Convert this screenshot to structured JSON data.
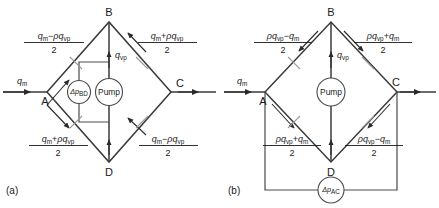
{
  "figure": {
    "panels": [
      {
        "id": "a",
        "caption": "(a)",
        "nodes": [
          {
            "id": "A",
            "label": "A"
          },
          {
            "id": "B",
            "label": "B"
          },
          {
            "id": "C",
            "label": "C"
          },
          {
            "id": "D",
            "label": "D"
          }
        ],
        "inlet_label": {
          "main": "q",
          "sub": "m"
        },
        "vertical_label": {
          "main": "q",
          "sub": "vp"
        },
        "instruments": [
          {
            "name": "delta-p-bd",
            "prefix": "Δp",
            "sub": "BD"
          },
          {
            "name": "pump",
            "text": "Pump"
          }
        ],
        "branch_labels": [
          {
            "position": "top-left",
            "numerator": "qₘ − ρqᵥₚ",
            "numerator_parts": [
              {
                "text": "q",
                "style": "italic"
              },
              {
                "text": "m",
                "style": "sub"
              },
              {
                "text": "−",
                "style": "op"
              },
              {
                "text": "ρq",
                "style": "italic"
              },
              {
                "text": "vp",
                "style": "sub"
              }
            ],
            "denominator": "2"
          },
          {
            "position": "top-right",
            "numerator": "qₘ + ρqᵥₚ",
            "numerator_parts": [
              {
                "text": "q",
                "style": "italic"
              },
              {
                "text": "m",
                "style": "sub"
              },
              {
                "text": "+",
                "style": "op"
              },
              {
                "text": "ρq",
                "style": "italic"
              },
              {
                "text": "vp",
                "style": "sub"
              }
            ],
            "denominator": "2"
          },
          {
            "position": "bottom-left",
            "numerator": "qₘ + ρqᵥₚ",
            "numerator_parts": [
              {
                "text": "q",
                "style": "italic"
              },
              {
                "text": "m",
                "style": "sub"
              },
              {
                "text": "+",
                "style": "op"
              },
              {
                "text": "ρq",
                "style": "italic"
              },
              {
                "text": "vp",
                "style": "sub"
              }
            ],
            "denominator": "2"
          },
          {
            "position": "bottom-right",
            "numerator": "qₘ − ρqᵥₚ",
            "numerator_parts": [
              {
                "text": "q",
                "style": "italic"
              },
              {
                "text": "m",
                "style": "sub"
              },
              {
                "text": "−",
                "style": "op"
              },
              {
                "text": "ρq",
                "style": "italic"
              },
              {
                "text": "vp",
                "style": "sub"
              }
            ],
            "denominator": "2"
          }
        ]
      },
      {
        "id": "b",
        "caption": "(b)",
        "nodes": [
          {
            "id": "A",
            "label": "A"
          },
          {
            "id": "B",
            "label": "B"
          },
          {
            "id": "C",
            "label": "C"
          },
          {
            "id": "D",
            "label": "D"
          }
        ],
        "inlet_label": {
          "main": "q",
          "sub": "m"
        },
        "vertical_label": {
          "main": "q",
          "sub": "vp"
        },
        "instruments": [
          {
            "name": "pump",
            "text": "Pump"
          },
          {
            "name": "delta-p-ac",
            "prefix": "Δp",
            "sub": "AC"
          }
        ],
        "branch_labels": [
          {
            "position": "top-left",
            "numerator": "ρqᵥₚ − qₘ",
            "numerator_parts": [
              {
                "text": "ρq",
                "style": "italic"
              },
              {
                "text": "vp",
                "style": "sub"
              },
              {
                "text": "−",
                "style": "op"
              },
              {
                "text": "q",
                "style": "italic"
              },
              {
                "text": "m",
                "style": "sub"
              }
            ],
            "denominator": "2"
          },
          {
            "position": "top-right",
            "numerator": "ρqᵥₚ + qₘ",
            "numerator_parts": [
              {
                "text": "ρq",
                "style": "italic"
              },
              {
                "text": "vp",
                "style": "sub"
              },
              {
                "text": "+",
                "style": "op"
              },
              {
                "text": "q",
                "style": "italic"
              },
              {
                "text": "m",
                "style": "sub"
              }
            ],
            "denominator": "2"
          },
          {
            "position": "bottom-left",
            "numerator": "ρqᵥₚ + qₘ",
            "numerator_parts": [
              {
                "text": "ρq",
                "style": "italic"
              },
              {
                "text": "vp",
                "style": "sub"
              },
              {
                "text": "+",
                "style": "op"
              },
              {
                "text": "q",
                "style": "italic"
              },
              {
                "text": "m",
                "style": "sub"
              }
            ],
            "denominator": "2"
          },
          {
            "position": "bottom-right",
            "numerator": "ρqᵥₚ − qₘ",
            "numerator_parts": [
              {
                "text": "ρq",
                "style": "italic"
              },
              {
                "text": "vp",
                "style": "sub"
              },
              {
                "text": "−",
                "style": "op"
              },
              {
                "text": "q",
                "style": "italic"
              },
              {
                "text": "m",
                "style": "sub"
              }
            ],
            "denominator": "2"
          }
        ]
      }
    ]
  },
  "panel_a": {
    "caption": "(a)",
    "node_a": "A",
    "node_b": "B",
    "node_c": "C",
    "node_d": "D",
    "inlet_main": "q",
    "inlet_sub": "m",
    "vert_main": "q",
    "vert_sub": "vp",
    "dp_prefix": "Δp",
    "dp_sub": "BD",
    "pump_text": "Pump",
    "tl_n1": "q",
    "tl_s1": "m",
    "tl_op": "−",
    "tl_n2": "ρq",
    "tl_s2": "vp",
    "tl_den": "2",
    "tr_n1": "q",
    "tr_s1": "m",
    "tr_op": "+",
    "tr_n2": "ρq",
    "tr_s2": "vp",
    "tr_den": "2",
    "bl_n1": "q",
    "bl_s1": "m",
    "bl_op": "+",
    "bl_n2": "ρq",
    "bl_s2": "vp",
    "bl_den": "2",
    "br_n1": "q",
    "br_s1": "m",
    "br_op": "−",
    "br_n2": "ρq",
    "br_s2": "vp",
    "br_den": "2"
  },
  "panel_b": {
    "caption": "(b)",
    "node_a": "A",
    "node_b": "B",
    "node_c": "C",
    "node_d": "D",
    "inlet_main": "q",
    "inlet_sub": "m",
    "vert_main": "q",
    "vert_sub": "vp",
    "dp_prefix": "Δp",
    "dp_sub": "AC",
    "pump_text": "Pump",
    "tl_n1": "ρq",
    "tl_s1": "vp",
    "tl_op": "−",
    "tl_n2": "q",
    "tl_s2": "m",
    "tl_den": "2",
    "tr_n1": "ρq",
    "tr_s1": "vp",
    "tr_op": "+",
    "tr_n2": "q",
    "tr_s2": "m",
    "tr_den": "2",
    "bl_n1": "ρq",
    "bl_s1": "vp",
    "bl_op": "+",
    "bl_n2": "q",
    "bl_s2": "m",
    "bl_den": "2",
    "br_n1": "ρq",
    "br_s1": "vp",
    "br_op": "−",
    "br_n2": "q",
    "br_s2": "m",
    "br_den": "2"
  },
  "colors": {
    "pipe": "#3a3a3a",
    "text": "#1a1a1a",
    "tick": "#9a9a9a",
    "background": "#ffffff"
  }
}
